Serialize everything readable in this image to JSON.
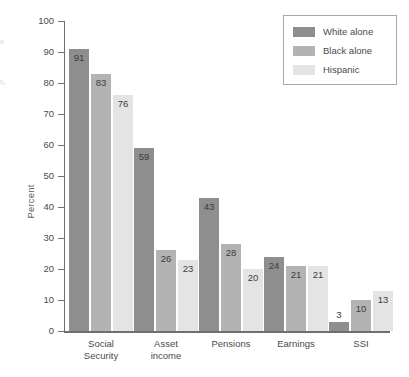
{
  "chart_data": {
    "type": "bar",
    "title": "",
    "xlabel": "",
    "ylabel": "Percent",
    "ylim": [
      0,
      100
    ],
    "ytick_step": 10,
    "grid": false,
    "legend_position": "top-right",
    "categories": [
      "Social Security",
      "Asset income",
      "Pensions",
      "Earnings",
      "SSI"
    ],
    "category_lines": [
      [
        "Social",
        "Security"
      ],
      [
        "Asset",
        "income"
      ],
      [
        "Pensions",
        ""
      ],
      [
        "Earnings",
        ""
      ],
      [
        "SSI",
        ""
      ]
    ],
    "yticks": [
      "0",
      "10",
      "20",
      "30",
      "40",
      "50",
      "60",
      "70",
      "80",
      "90",
      "100"
    ],
    "series": [
      {
        "name": "White alone",
        "color": "#8e8e8e",
        "values": [
          91,
          59,
          43,
          24,
          3
        ]
      },
      {
        "name": "Black alone",
        "color": "#b3b3b3",
        "values": [
          83,
          26,
          28,
          21,
          10
        ]
      },
      {
        "name": "Hispanic",
        "color": "#e4e4e4",
        "values": [
          76,
          23,
          20,
          21,
          13
        ]
      }
    ]
  },
  "edge_artifacts": {
    "line_a": "e",
    "line_b": "s,"
  }
}
